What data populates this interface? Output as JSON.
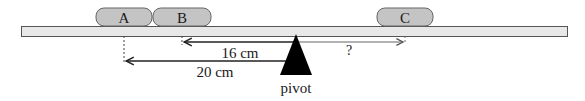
{
  "diagram": {
    "type": "lever-balance",
    "beam": {
      "color": "#e8e8e8",
      "border": "#555555"
    },
    "objects": [
      {
        "label": "A",
        "color": "#c4c4c4"
      },
      {
        "label": "B",
        "color": "#c4c4c4"
      },
      {
        "label": "C",
        "color": "#c4c4c4"
      }
    ],
    "distances": [
      {
        "from": "B",
        "to": "pivot",
        "label": "16 cm"
      },
      {
        "from": "A",
        "to": "pivot",
        "label": "20 cm"
      },
      {
        "from": "pivot",
        "to": "C",
        "label": "?"
      }
    ],
    "pivot": {
      "label": "pivot",
      "color": "#000000"
    }
  }
}
